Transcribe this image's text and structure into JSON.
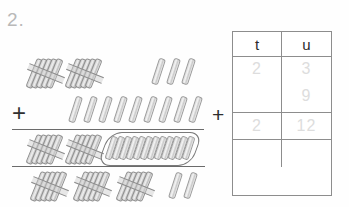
{
  "worksheet": {
    "problem_number": "2.",
    "operator_left": "+",
    "operator_right": "+"
  },
  "manipulatives": {
    "description": "base-ten bundles of ten sticks and loose unit sticks",
    "rows": [
      {
        "name": "addend-1",
        "tens_bundles": 2,
        "loose_units": 3
      },
      {
        "name": "addend-2",
        "tens_bundles": 0,
        "loose_units": 9
      },
      {
        "name": "sum-row",
        "tens_bundles": 2,
        "loose_units": 12,
        "units_grouped": true
      },
      {
        "name": "regrouped-row",
        "tens_bundles": 3,
        "loose_units": 2
      }
    ]
  },
  "place_value_table": {
    "headers": {
      "tens": "t",
      "units": "u"
    },
    "rows": [
      {
        "tens": "2",
        "units_top": "3",
        "units_bottom": "9"
      },
      {
        "tens": "2",
        "units_top": "12",
        "units_bottom": ""
      },
      {
        "tens": "",
        "units_top": "",
        "units_bottom": ""
      }
    ]
  },
  "colors": {
    "ink": "#2b2b2b",
    "faint_answer": "#dddddd",
    "rule": "#6b6b6b",
    "table_border": "#8d8d8d",
    "stick_outline": "#9b9b9b"
  }
}
